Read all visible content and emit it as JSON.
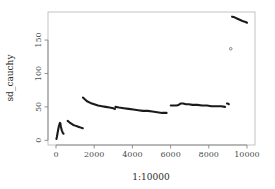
{
  "chart_data": {
    "type": "scatter",
    "title": "",
    "subtitle": "",
    "xlabel": "1:10000",
    "ylabel": "sd_cauchy",
    "xlim": [
      -420,
      10420
    ],
    "ylim": [
      -7,
      192
    ],
    "grid": false,
    "legend": null,
    "legend_position": "none",
    "xticks": [
      0,
      2000,
      4000,
      6000,
      8000,
      10000
    ],
    "xtick_labels": [
      "0",
      "2000",
      "4000",
      "6000",
      "8000",
      "10000"
    ],
    "yticks": [
      0,
      50,
      100,
      150
    ],
    "ytick_labels": [
      "0",
      "50",
      "100",
      "150"
    ],
    "point_color": "#1a1a1a",
    "plot_background": "#ffffff",
    "frame_color": "#b4b4b4",
    "axis_color": "#7a7a7a",
    "marker": "open-circle",
    "marker_size": 1.2,
    "series": [
      {
        "name": "spike-at-origin-rise",
        "points": [
          [
            20,
            2
          ],
          [
            45,
            5
          ],
          [
            70,
            9
          ],
          [
            95,
            13
          ],
          [
            120,
            17
          ],
          [
            150,
            21
          ],
          [
            180,
            24
          ],
          [
            205,
            26
          ],
          [
            225,
            25
          ]
        ]
      },
      {
        "name": "spike-at-origin-fall",
        "points": [
          [
            225,
            25
          ],
          [
            250,
            21
          ],
          [
            275,
            18
          ],
          [
            300,
            15
          ],
          [
            330,
            13
          ],
          [
            360,
            11
          ],
          [
            395,
            10
          ]
        ]
      },
      {
        "name": "short-decay-arc",
        "points": [
          [
            610,
            29
          ],
          [
            700,
            27
          ],
          [
            800,
            25
          ],
          [
            900,
            23
          ],
          [
            1000,
            22
          ],
          [
            1100,
            21
          ],
          [
            1200,
            20
          ],
          [
            1300,
            19
          ],
          [
            1400,
            18
          ]
        ]
      },
      {
        "name": "band-1400-3100",
        "points": [
          [
            1410,
            64
          ],
          [
            1520,
            61
          ],
          [
            1650,
            58
          ],
          [
            1800,
            56
          ],
          [
            2000,
            54
          ],
          [
            2200,
            52
          ],
          [
            2400,
            51
          ],
          [
            2600,
            50
          ],
          [
            2800,
            49
          ],
          [
            3000,
            48
          ],
          [
            3090,
            47
          ]
        ]
      },
      {
        "name": "band-3100-5800",
        "points": [
          [
            3110,
            50
          ],
          [
            3300,
            49
          ],
          [
            3550,
            48
          ],
          [
            3800,
            47
          ],
          [
            4050,
            46
          ],
          [
            4300,
            45
          ],
          [
            4550,
            44
          ],
          [
            4800,
            44
          ],
          [
            5050,
            43
          ],
          [
            5300,
            42
          ],
          [
            5550,
            41
          ],
          [
            5790,
            41
          ]
        ]
      },
      {
        "name": "plateau-6000-9000",
        "points": [
          [
            6010,
            52
          ],
          [
            6150,
            52
          ],
          [
            6300,
            52
          ],
          [
            6420,
            53
          ],
          [
            6520,
            55
          ],
          [
            6660,
            55
          ],
          [
            6800,
            54
          ],
          [
            6950,
            54
          ],
          [
            7150,
            53
          ],
          [
            7400,
            53
          ],
          [
            7650,
            52
          ],
          [
            7900,
            52
          ],
          [
            8150,
            51
          ],
          [
            8400,
            51
          ],
          [
            8650,
            51
          ],
          [
            8850,
            50
          ]
        ]
      },
      {
        "name": "short-step-8950-9050",
        "points": [
          [
            8950,
            55
          ],
          [
            9000,
            55
          ],
          [
            9050,
            54
          ]
        ]
      },
      {
        "name": "isolated-outlier",
        "points": [
          [
            9150,
            137
          ]
        ]
      },
      {
        "name": "high-segment-9200-10000",
        "points": [
          [
            9220,
            185
          ],
          [
            9350,
            184
          ],
          [
            9500,
            182
          ],
          [
            9650,
            180
          ],
          [
            9800,
            178
          ],
          [
            9930,
            177
          ],
          [
            10000,
            176
          ]
        ]
      }
    ]
  }
}
